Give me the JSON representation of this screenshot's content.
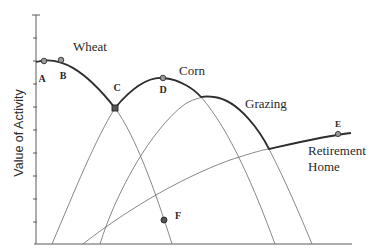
{
  "diagram": {
    "y_axis_label": "Value of Activity",
    "curves": [
      {
        "id": "wheat",
        "label": "Wheat"
      },
      {
        "id": "corn",
        "label": "Corn"
      },
      {
        "id": "grazing",
        "label": "Grazing"
      },
      {
        "id": "retirement",
        "label_line1": "Retirement",
        "label_line2": "Home"
      }
    ],
    "points": [
      {
        "id": "A",
        "label": "A"
      },
      {
        "id": "B",
        "label": "B"
      },
      {
        "id": "C",
        "label": "C"
      },
      {
        "id": "D",
        "label": "D"
      },
      {
        "id": "E",
        "label": "E"
      },
      {
        "id": "F",
        "label": "F"
      }
    ],
    "colors": {
      "envelope": "#2e2e2e",
      "curve": "#6a6a6a",
      "point_fill": "#9a9a9a"
    }
  }
}
